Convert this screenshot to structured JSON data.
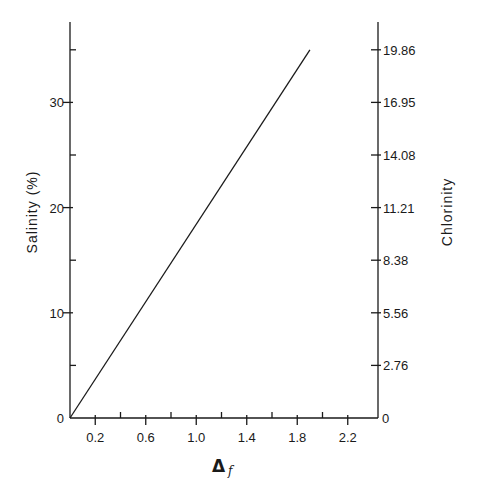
{
  "chart_data": {
    "type": "line",
    "title": "",
    "xlabel": "Δ f",
    "xlabel_main": "Δ",
    "xlabel_sub": "f",
    "ylabel": "Salinity (%)",
    "y2label": "Chlorinity",
    "xlim": [
      0,
      2.4
    ],
    "ylim": [
      0,
      37
    ],
    "x_ticks_major": [
      0.2,
      0.6,
      1.0,
      1.4,
      1.8,
      2.2
    ],
    "x_tick_labels": [
      "0.2",
      "0.6",
      "1.0",
      "1.4",
      "1.8",
      "2.2"
    ],
    "x_ticks_minor": [
      0.4,
      0.8,
      1.2,
      1.6,
      2.0
    ],
    "y_ticks_major": [
      0,
      10,
      20,
      30
    ],
    "y_tick_labels": [
      "0",
      "10",
      "20",
      "30"
    ],
    "y_ticks_minor": [
      5,
      15,
      25,
      35
    ],
    "y2_ticks_at_salinity": [
      0,
      5,
      10,
      15,
      20,
      25,
      30,
      35
    ],
    "y2_tick_labels": [
      "0",
      "2.76",
      "5.56",
      "8.38",
      "11.21",
      "14.08",
      "16.95",
      "19.86"
    ],
    "grid": false,
    "legend": null,
    "series": [
      {
        "name": "Salinity vs freezing point depression",
        "x": [
          0,
          1.9
        ],
        "y": [
          0,
          35.0
        ]
      }
    ],
    "colors": {
      "line": "#1a1a1a",
      "axis": "#1a1a1a",
      "background": "#ffffff"
    }
  }
}
